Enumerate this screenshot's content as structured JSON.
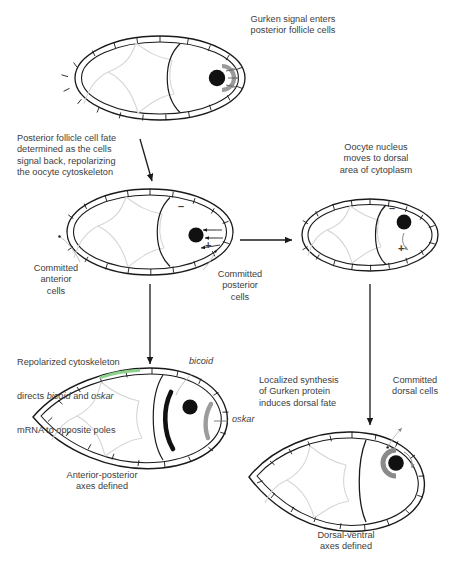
{
  "figure": {
    "title_visible": false,
    "background": "#ffffff",
    "text_color": "#3d3d3d",
    "line_color": "#1a1a1a",
    "faint_cell_color": "#d8d8d8",
    "nucleus_color": "#111111",
    "gurken_color": "#9a9a9a",
    "bicoid_color": "#111111",
    "oskar_color": "#9c9c9c",
    "accent_green": "#8fd18f"
  },
  "labels": {
    "gurken_enters": "Gurken signal enters\nposterior follicle cells",
    "posterior_fate": "Posterior follicle cell fate\ndetermined as the cells\nsignal back, repolarizing\nthe oocyte cytoskeleton",
    "oocyte_nucleus_moves": "Oocyte nucleus\nmoves to dorsal\narea of cytoplasm",
    "committed_anterior": "Committed\nanterior\ncells",
    "committed_posterior": "Committed\nposterior\ncells",
    "repolarized": "Repolarized cytoskeleton\ndirects bicoid and oskar\nmRNA to opposite poles",
    "repolarized_line1": "Repolarized cytoskeleton",
    "repolarized_line2_a": "directs ",
    "repolarized_line2_bicoid": "bicoid",
    "repolarized_line2_b": " and ",
    "repolarized_line2_oskar": "oskar",
    "repolarized_line3": "mRNA to opposite poles",
    "bicoid": "bicoid",
    "oskar": "oskar",
    "ap_axes": "Anterior-posterior\naxes defined",
    "localized_synthesis": "Localized synthesis\nof Gurken protein\ninduces dorsal fate",
    "committed_dorsal": "Committed\ndorsal cells",
    "dv_axes": "Dorsal-ventral\naxes defined"
  },
  "signs": {
    "minus": "–",
    "plus": "+"
  },
  "panels": [
    {
      "id": "panel-1-gurken-signal",
      "stage": "Gurken signal enters posterior follicle cells",
      "shape": "oval"
    },
    {
      "id": "panel-2-posterior-fate",
      "stage": "Posterior follicle cell fate determined",
      "shape": "oval",
      "polarity": [
        "minus anterior-dorsal",
        "plus posterior"
      ]
    },
    {
      "id": "panel-3-nucleus-migration",
      "stage": "Oocyte nucleus moves to dorsal area",
      "shape": "oval",
      "polarity": [
        "minus",
        "plus"
      ]
    },
    {
      "id": "panel-4-ap-axes",
      "stage": "Anterior-posterior axes defined",
      "shape": "teardrop",
      "mrna": [
        "bicoid",
        "oskar"
      ]
    },
    {
      "id": "panel-5-dv-axes",
      "stage": "Dorsal-ventral axes defined",
      "shape": "teardrop"
    }
  ]
}
